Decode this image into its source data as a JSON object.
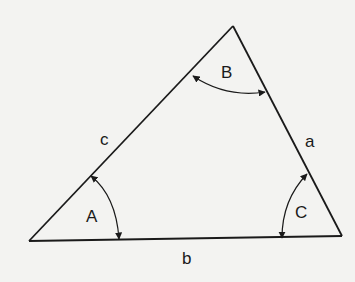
{
  "diagram": {
    "type": "triangle",
    "background": "#f3f3f1",
    "stroke_color": "#1a1a1a",
    "vertices": {
      "A": {
        "x": 29,
        "y": 241
      },
      "B": {
        "x": 233,
        "y": 26
      },
      "C": {
        "x": 342,
        "y": 236
      }
    },
    "sides": {
      "a": {
        "label": "a",
        "between": [
          "B",
          "C"
        ]
      },
      "b": {
        "label": "b",
        "between": [
          "A",
          "C"
        ]
      },
      "c": {
        "label": "c",
        "between": [
          "A",
          "B"
        ]
      }
    },
    "angles": {
      "A": {
        "label": "A"
      },
      "B": {
        "label": "B"
      },
      "C": {
        "label": "C"
      }
    }
  }
}
